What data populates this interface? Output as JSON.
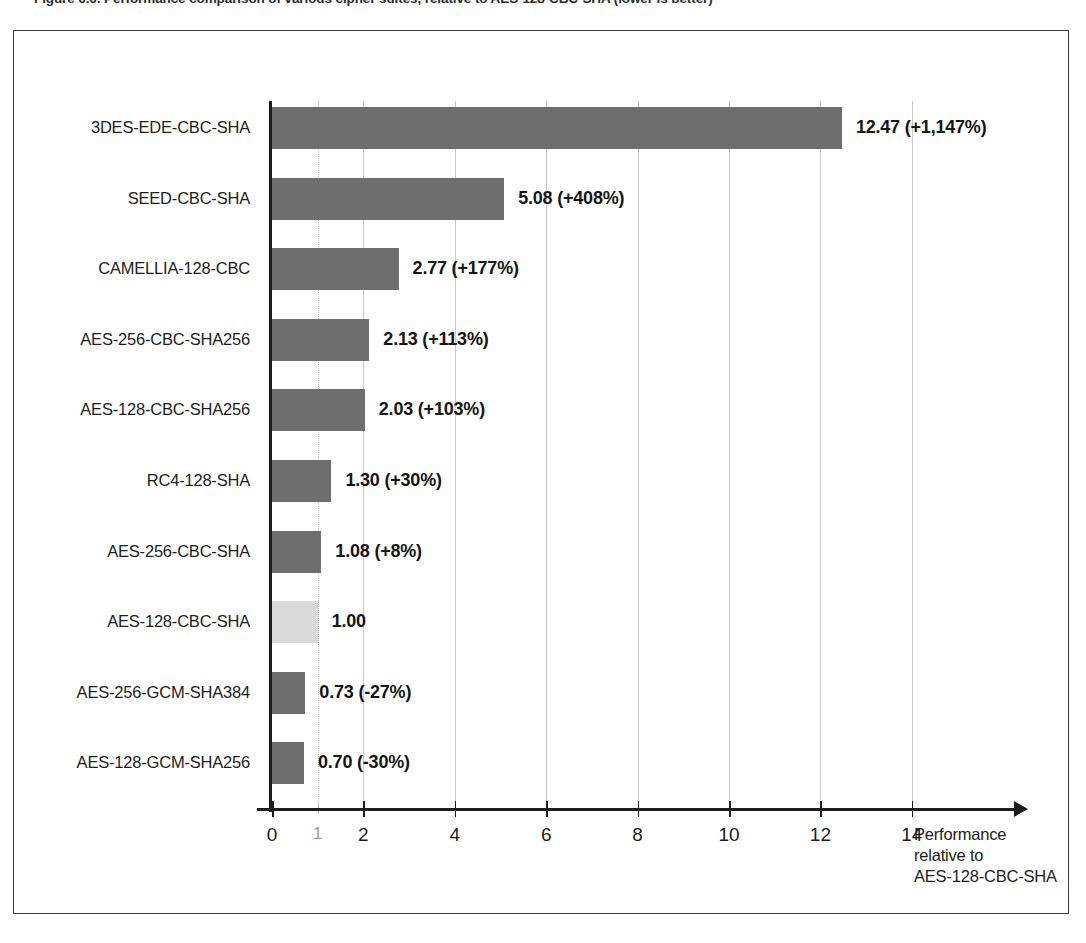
{
  "caption": "Figure 6.6. Performance comparison of various cipher suites, relative to AES-128-CBC-SHA (lower is better)",
  "axis_title": {
    "line1": "Performance",
    "line2": "relative to",
    "line3": "AES-128-CBC-SHA"
  },
  "colors": {
    "bar": "#6e6e6e",
    "bar_highlight": "#d9d9d9",
    "axis": "#1c1c1c",
    "grid": "#c9c9c9"
  },
  "chart_data": {
    "type": "bar",
    "orientation": "horizontal",
    "title": "Figure 6.6. Performance comparison of various cipher suites, relative to AES-128-CBC-SHA (lower is better)",
    "xlabel": "Performance relative to AES-128-CBC-SHA",
    "ylabel": "",
    "xlim": [
      0,
      15.2
    ],
    "grid": true,
    "legend": "none",
    "baseline": 1.0,
    "xticks": [
      0,
      1,
      2,
      4,
      6,
      8,
      10,
      12,
      14
    ],
    "xtick_labels": [
      "0",
      "1",
      "2",
      "4",
      "6",
      "8",
      "10",
      "12",
      "14"
    ],
    "categories": [
      "3DES-EDE-CBC-SHA",
      "SEED-CBC-SHA",
      "CAMELLIA-128-CBC",
      "AES-256-CBC-SHA256",
      "AES-128-CBC-SHA256",
      "RC4-128-SHA",
      "AES-256-CBC-SHA",
      "AES-128-CBC-SHA",
      "AES-256-GCM-SHA384",
      "AES-128-GCM-SHA256"
    ],
    "values": [
      12.47,
      5.08,
      2.77,
      2.13,
      2.03,
      1.3,
      1.08,
      1.0,
      0.73,
      0.7
    ],
    "data_labels": [
      "12.47 (+1,147%)",
      "5.08 (+408%)",
      "2.77 (+177%)",
      "2.13 (+113%)",
      "2.03 (+103%)",
      "1.30 (+30%)",
      "1.08 (+8%)",
      "1.00",
      "0.73 (-27%)",
      "0.70 (-30%)"
    ],
    "percent_change": [
      "+1,147%",
      "+408%",
      "+177%",
      "+113%",
      "+103%",
      "+30%",
      "+8%",
      "",
      "-27%",
      "-30%"
    ],
    "highlight_index": 7
  }
}
